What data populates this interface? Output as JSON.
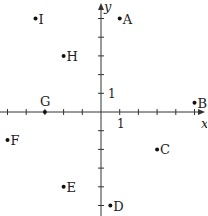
{
  "diagram": {
    "type": "coordinate-plane",
    "axes": {
      "x_label": "x",
      "y_label": "y",
      "unit_label_x": "1",
      "unit_label_y": "1",
      "x_range": [
        -5,
        5
      ],
      "y_range": [
        -5,
        5
      ],
      "tick_step": 1
    },
    "points": [
      {
        "label": "A",
        "x": 1,
        "y": 5
      },
      {
        "label": "B",
        "x": 5,
        "y": 0.5
      },
      {
        "label": "C",
        "x": 3,
        "y": -2
      },
      {
        "label": "D",
        "x": 0.5,
        "y": -5
      },
      {
        "label": "E",
        "x": -2,
        "y": -4
      },
      {
        "label": "F",
        "x": -5,
        "y": -1.5
      },
      {
        "label": "G",
        "x": -3,
        "y": 0
      },
      {
        "label": "H",
        "x": -2,
        "y": 3
      },
      {
        "label": "I",
        "x": -3.5,
        "y": 5
      }
    ],
    "colors": {
      "axis": "#333333",
      "point": "#111111",
      "text": "#222222"
    }
  }
}
